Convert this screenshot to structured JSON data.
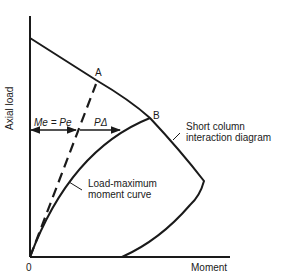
{
  "diagram": {
    "axes": {
      "y_label": "Axial load",
      "x_label": "Moment",
      "origin_label": "0"
    },
    "points": {
      "a": "A",
      "b": "B"
    },
    "annotations": {
      "eccentric_moment": "Me = Pe",
      "second_order_moment": "PΔ",
      "short_column_line1": "Short column",
      "short_column_line2": "interaction diagram",
      "load_moment_line1": "Load-maximum",
      "load_moment_line2": "moment curve"
    },
    "colors": {
      "ink": "#1a1a1a",
      "background": "#ffffff"
    }
  }
}
